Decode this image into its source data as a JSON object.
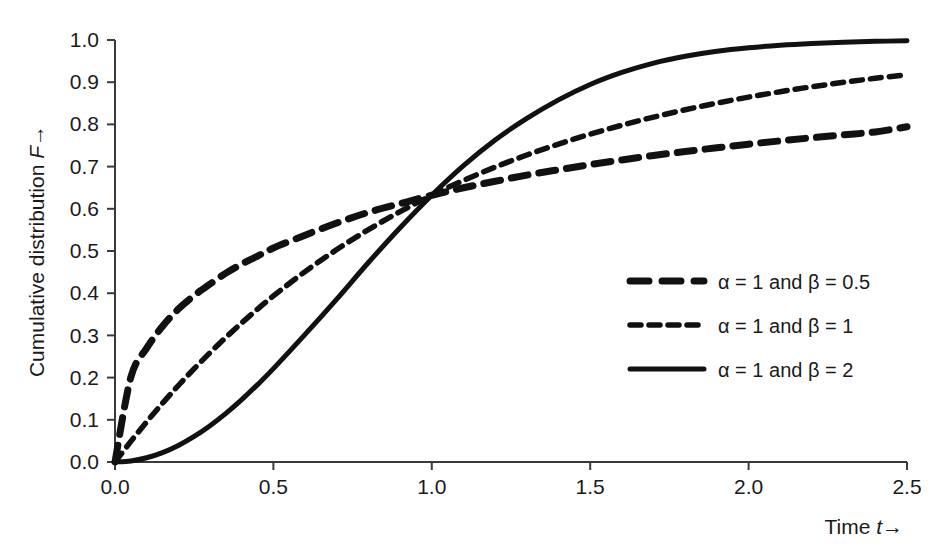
{
  "chart_data": {
    "type": "line",
    "title": "",
    "xlabel": "Time t→",
    "ylabel": "Cumulative distribution F→",
    "xlim": [
      0.0,
      2.5
    ],
    "ylim": [
      0.0,
      1.0
    ],
    "grid": false,
    "legend_position": "center-right",
    "x_ticks": [
      "0.0",
      "0.5",
      "1.0",
      "1.5",
      "2.0",
      "2.5"
    ],
    "x_tick_values": [
      0.0,
      0.5,
      1.0,
      1.5,
      2.0,
      2.5
    ],
    "y_ticks": [
      "0.0",
      "0.1",
      "0.2",
      "0.3",
      "0.4",
      "0.5",
      "0.6",
      "0.7",
      "0.8",
      "0.9",
      "1.0"
    ],
    "y_tick_values": [
      0.0,
      0.1,
      0.2,
      0.3,
      0.4,
      0.5,
      0.6,
      0.7,
      0.8,
      0.9,
      1.0
    ],
    "x": [
      0.0,
      0.05,
      0.1,
      0.15,
      0.2,
      0.25,
      0.3,
      0.35,
      0.4,
      0.45,
      0.5,
      0.6,
      0.7,
      0.8,
      0.9,
      1.0,
      1.1,
      1.2,
      1.3,
      1.4,
      1.5,
      1.6,
      1.7,
      1.8,
      1.9,
      2.0,
      2.1,
      2.2,
      2.3,
      2.4,
      2.5
    ],
    "series": [
      {
        "name": "α = 1 and β = 0.5",
        "style": "long-dashed",
        "values": [
          0.0,
          0.2009,
          0.2697,
          0.3216,
          0.3624,
          0.3946,
          0.4218,
          0.4475,
          0.4691,
          0.4878,
          0.5071,
          0.5376,
          0.5663,
          0.5918,
          0.6122,
          0.6321,
          0.6498,
          0.6652,
          0.6799,
          0.6926,
          0.7047,
          0.7158,
          0.7263,
          0.7358,
          0.7447,
          0.7532,
          0.761,
          0.7684,
          0.7754,
          0.7821,
          0.7945
        ]
      },
      {
        "name": "α = 1 and β = 1",
        "style": "short-dashed",
        "values": [
          0.0,
          0.0488,
          0.0952,
          0.1393,
          0.1813,
          0.2212,
          0.2592,
          0.2953,
          0.3297,
          0.3624,
          0.3935,
          0.4512,
          0.5034,
          0.5507,
          0.5934,
          0.6321,
          0.6671,
          0.6988,
          0.7275,
          0.7534,
          0.7769,
          0.7981,
          0.8173,
          0.8347,
          0.8504,
          0.8647,
          0.8775,
          0.8892,
          0.8997,
          0.9093,
          0.9179
        ]
      },
      {
        "name": "α = 1 and β = 2",
        "style": "solid",
        "values": [
          0.0,
          0.0025,
          0.01,
          0.0223,
          0.0392,
          0.0606,
          0.0861,
          0.1153,
          0.1479,
          0.1834,
          0.2212,
          0.3023,
          0.3861,
          0.4727,
          0.5551,
          0.6321,
          0.7022,
          0.7631,
          0.8141,
          0.8581,
          0.8946,
          0.9231,
          0.9453,
          0.9615,
          0.9735,
          0.9817,
          0.9877,
          0.9919,
          0.9948,
          0.9968,
          0.9981
        ]
      }
    ],
    "annotations": [
      "All three curves intersect at t = 1.0, F ≈ 0.632"
    ]
  },
  "legend": {
    "entries": [
      {
        "label": "α = 1 and β = 0.5"
      },
      {
        "label": "α = 1 and β = 1"
      },
      {
        "label": "α = 1 and β = 2"
      }
    ]
  },
  "axes": {
    "y_label_text": "Cumulative distribution ",
    "y_label_symbol": "F",
    "y_label_arrow": "→",
    "x_label_text": "Time ",
    "x_label_symbol": "t",
    "x_label_arrow": "→"
  },
  "colors": {
    "curve": "#111111",
    "axis": "#3a3a3a",
    "text": "#1a1a1a",
    "background": "#ffffff"
  }
}
